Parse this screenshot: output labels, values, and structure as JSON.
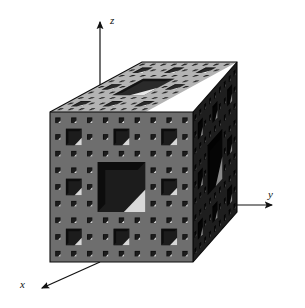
{
  "figure": {
    "background_color": "#ffffff"
  },
  "axes": {
    "z": {
      "label": "z",
      "direction": "up",
      "arrow": "arrowhead-up"
    },
    "y": {
      "label": "y",
      "direction": "right",
      "arrow": "arrowhead-right"
    },
    "x": {
      "label": "x",
      "direction": "down-left",
      "arrow": "arrowhead-down-left"
    },
    "line_color": "#111111"
  },
  "solid": {
    "name": "menger-sponge",
    "iteration_level": 3,
    "subdivisions": 27,
    "faces": {
      "top": {
        "name": "top-face",
        "color": "#b4b4b4",
        "hole_color": "#2a2a2a",
        "highlight_color": "#e8e8e8"
      },
      "front": {
        "name": "front-face",
        "color": "#6e6e6e",
        "hole_color": "#1c1c1c",
        "highlight_color": "#d8d8d8"
      },
      "right": {
        "name": "right-face",
        "color": "#1e1e1e",
        "hole_color": "#050505",
        "highlight_color": "#8a8a8a"
      }
    },
    "outline_color": "#0a0a0a"
  },
  "chart_data": {
    "type": "diagram",
    "xlabel": "x",
    "ylabel": "y",
    "zlabel": "z",
    "fractal": {
      "name": "Menger sponge",
      "level": 3,
      "dimension": 2.7268,
      "cubes_remaining": 20,
      "cubes_removed": 7,
      "grid": 3
    }
  }
}
